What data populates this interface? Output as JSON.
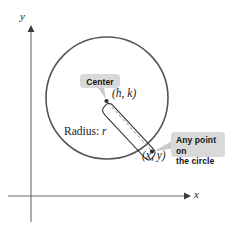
{
  "figure": {
    "background_color": "#ffffff"
  },
  "axes": {
    "x_label": "x",
    "y_label": "y",
    "axis_color": "#6b6b6b",
    "x_axis": {
      "y_px": 196,
      "x_start_px": 8,
      "x_end_px": 188,
      "arrow": "right"
    },
    "y_axis": {
      "x_px": 31,
      "y_start_px": 222,
      "y_end_px": 27,
      "arrow": "up"
    }
  },
  "circle": {
    "center_px": {
      "x": 107,
      "y": 98
    },
    "radius_px": 61,
    "stroke_color": "#555555",
    "stroke_width": 1.6
  },
  "center_point": {
    "label": "(h, k)",
    "label_pos_px": {
      "x": 113,
      "y": 94
    },
    "dot_px": {
      "x": 106,
      "y": 101
    },
    "dot_color": "#2b2b2b"
  },
  "circle_point": {
    "label": "(x, y)",
    "label_pos_px": {
      "x": 143,
      "y": 155
    },
    "dot_px": {
      "x": 152,
      "y": 152
    },
    "dot_color": "#2b2b2b"
  },
  "radius": {
    "label_text": "Radius:",
    "label_variable": "r",
    "label_pos_px": {
      "x": 67,
      "y": 132
    },
    "dashed_line": {
      "from_px": {
        "x": 107,
        "y": 102
      },
      "to_px": {
        "x": 151,
        "y": 151
      },
      "color": "#8a8a8a",
      "dash": "3 2.5"
    },
    "brace_color": "#2b2b2b"
  },
  "callouts": [
    {
      "id": "center-callout",
      "text": "Center",
      "box_px": {
        "x": 80,
        "y": 74,
        "w": 40,
        "h": 14
      },
      "background": "#d9d9d9",
      "leader_from_px": {
        "x": 102,
        "y": 88
      },
      "leader_to_px": {
        "x": 106,
        "y": 100
      },
      "leader_color": "#c4c4c4"
    },
    {
      "id": "any-point-callout",
      "line1": "Any point on",
      "line2": "the circle",
      "box_px": {
        "x": 171,
        "y": 132,
        "w": 54,
        "h": 25
      },
      "background": "#d9d9d9",
      "leader_from_px": {
        "x": 171,
        "y": 146
      },
      "leader_to_px": {
        "x": 154,
        "y": 151
      },
      "leader_color": "#c4c4c4"
    }
  ],
  "colors": {
    "axis": "#6b6b6b",
    "circle_stroke": "#555555",
    "dashed": "#8a8a8a",
    "callout_bg": "#d9d9d9",
    "callout_text": "#141414",
    "text": "#1a1a1a"
  }
}
